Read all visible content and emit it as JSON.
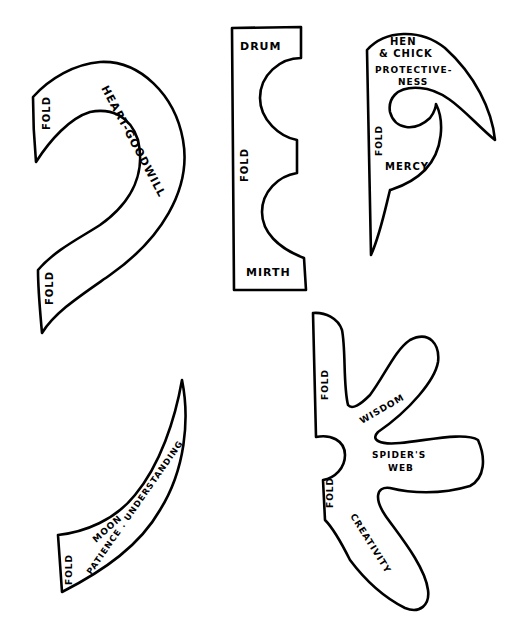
{
  "page": {
    "background": "#ffffff",
    "ink_color": "#000000"
  },
  "templates": [
    {
      "id": "heart-goodwill",
      "labels": {
        "main": "HEART-GOODWILL",
        "fold_top": "FOLD",
        "fold_bottom": "FOLD"
      }
    },
    {
      "id": "drum-mirth",
      "labels": {
        "top": "DRUM",
        "fold": "FOLD",
        "bottom": "MIRTH"
      }
    },
    {
      "id": "hen-chick",
      "labels": {
        "line1": "HEN",
        "line2": "& CHICK",
        "line3": "PROTECTIVE-",
        "line4": "NESS",
        "fold": "FOLD",
        "inner": "MERCY"
      }
    },
    {
      "id": "moon",
      "labels": {
        "main": "MOON",
        "sub": "PATIENCE . UNDERSTANDING",
        "fold": "FOLD"
      }
    },
    {
      "id": "spiders-web",
      "labels": {
        "fold_top": "FOLD",
        "arm_upper": "WISDOM",
        "center_line1": "SPIDER'S",
        "center_line2": "WEB",
        "fold_bottom": "FOLD",
        "arm_lower": "CREATIVITY"
      }
    }
  ]
}
